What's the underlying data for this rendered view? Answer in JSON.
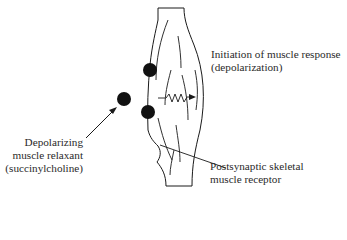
{
  "labels": {
    "initiation": {
      "line1": "Initiation of muscle response",
      "line2": "(depolarization)"
    },
    "relaxant": {
      "line1": "Depolarizing",
      "line2": "muscle relaxant",
      "line3": "(succinylcholine)"
    },
    "receptor": {
      "line1": "Postsynaptic skeletal",
      "line2": "muscle receptor"
    }
  },
  "elements": {
    "muscle": "muscle-fiber",
    "free_molecule": "succinylcholine-molecule",
    "bound_molecules": [
      "bound-molecule-upper",
      "bound-molecule-lower"
    ],
    "signal": "depolarization-zigzag-arrow"
  },
  "colors": {
    "stroke": "#1a1a1a",
    "molecule": "#111111",
    "background": "#ffffff"
  }
}
